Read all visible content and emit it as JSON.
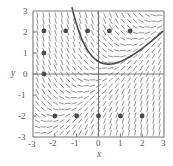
{
  "chart_data": {
    "type": "line",
    "title": "",
    "subtitle": "",
    "xlabel": "x",
    "ylabel": "y",
    "xlim": [
      -3,
      3
    ],
    "ylim": [
      -3,
      3
    ],
    "grid": false,
    "legend": "none",
    "x_ticks": [
      -3,
      -2,
      -1,
      0,
      1,
      2,
      3
    ],
    "x_tick_labels": [
      "-3",
      "-2",
      "-1",
      "0",
      "1",
      "2",
      "3"
    ],
    "y_ticks": [
      -3,
      -2,
      -1,
      0,
      1,
      2,
      3
    ],
    "y_tick_labels": [
      "-3",
      "-2",
      "-1",
      "0",
      "1",
      "2",
      "3"
    ],
    "plot_kind": "direction-field-with-solution-curve",
    "field": {
      "description": "slope field of dy/dx = x - y drawn as short dashes on a regular lattice",
      "slope_formula": "x - y",
      "x_start": -2.8,
      "x_end": 2.8,
      "y_start": -2.8,
      "y_end": 2.8,
      "step": 0.28,
      "dash_length": 5.0,
      "color": "#8c8c8c",
      "line_width": 0.9
    },
    "series": [
      {
        "name": "solution curve",
        "kind": "curve",
        "formula": "y = x - 1 + c*exp(-x)",
        "c": 1.6,
        "color": "#4a4a4a",
        "line_width": 1.6,
        "x_from": -2.62,
        "x_to": 2.95,
        "notable_points": {
          "left_start": [
            -2.6,
            0.0
          ],
          "minimum": [
            -1.55,
            -1.8
          ],
          "x_intercept": [
            0.85,
            0.0
          ],
          "right_end": [
            2.95,
            2.05
          ]
        }
      },
      {
        "name": "marked points",
        "kind": "scatter",
        "color": "#4a4a4a",
        "marker_size": 2.4,
        "points": [
          [
            -2.5,
            2.05
          ],
          [
            -1.5,
            2.05
          ],
          [
            -0.5,
            2.05
          ],
          [
            0.5,
            2.05
          ],
          [
            1.45,
            2.05
          ],
          [
            -2.5,
            1.0
          ],
          [
            -2.5,
            0.0
          ],
          [
            -2.0,
            -2.0
          ],
          [
            -1.0,
            -2.0
          ],
          [
            0.0,
            -2.0
          ],
          [
            1.0,
            -2.0
          ],
          [
            2.0,
            -2.0
          ]
        ]
      }
    ],
    "axes_style": {
      "frame_color": "#777777",
      "zero_line_color": "#6b6b6b",
      "tick_color": "#777777",
      "background": "#ffffff"
    }
  }
}
